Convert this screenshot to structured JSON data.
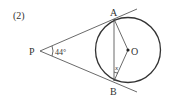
{
  "problem_label": "(2)",
  "points": {
    "P": "P",
    "A": "A",
    "B": "B",
    "O": "O"
  },
  "angle_label": "44°",
  "unknown_label": "x",
  "colors": {
    "stroke": "#333333",
    "background": "#ffffff"
  }
}
